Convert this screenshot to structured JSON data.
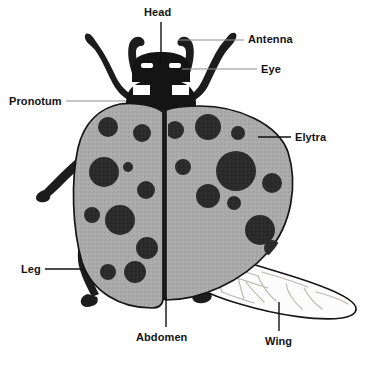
{
  "diagram": {
    "background_color": "#ffffff",
    "colors": {
      "body_dark": "#1f1f1f",
      "elytra_gray": "#a9a9a9",
      "elytra_gray_dark": "#9a9a9a",
      "spot_dark": "#2a2a2a",
      "abdomen_dark": "#3c3c3c",
      "wing_fill": "#fbfbfb",
      "wing_vein": "#b8b3ac",
      "outline": "#111111",
      "leader_gray": "#8f8f8f",
      "leader_black": "#111111",
      "label_text": "#131313"
    },
    "labels": [
      {
        "id": "head",
        "text": "Head",
        "x": 144,
        "y": 6,
        "leader": {
          "style": "black",
          "x1": 161,
          "y1": 22,
          "x2": 161,
          "y2": 66
        }
      },
      {
        "id": "antenna",
        "text": "Antenna",
        "x": 248,
        "y": 33,
        "leader": {
          "style": "gray",
          "x1": 244,
          "y1": 40,
          "x2": 178,
          "y2": 40
        }
      },
      {
        "id": "eye",
        "text": "Eye",
        "x": 261,
        "y": 63,
        "leader": {
          "style": "gray",
          "x1": 257,
          "y1": 69,
          "x2": 182,
          "y2": 69
        }
      },
      {
        "id": "pronotum",
        "text": "Pronotum",
        "x": 9,
        "y": 95,
        "leader": {
          "style": "gray",
          "x1": 66,
          "y1": 101,
          "x2": 126,
          "y2": 101
        }
      },
      {
        "id": "elytra",
        "text": "Elytra",
        "x": 295,
        "y": 131,
        "leader": {
          "style": "black",
          "x1": 291,
          "y1": 137,
          "x2": 258,
          "y2": 137
        }
      },
      {
        "id": "leg",
        "text": "Leg",
        "x": 21,
        "y": 263,
        "leader": {
          "style": "black",
          "x1": 45,
          "y1": 269,
          "x2": 84,
          "y2": 269
        }
      },
      {
        "id": "abdomen",
        "text": "Abdomen",
        "x": 136,
        "y": 331,
        "leader": {
          "style": "black",
          "x1": 166,
          "y1": 327,
          "x2": 166,
          "y2": 297
        }
      },
      {
        "id": "wing",
        "text": "Wing",
        "x": 265,
        "y": 335,
        "leader": {
          "style": "black",
          "x1": 279,
          "y1": 331,
          "x2": 279,
          "y2": 302
        }
      }
    ],
    "parts": {
      "head": "Head",
      "antenna": "Antenna",
      "eye": "Eye",
      "pronotum": "Pronotum",
      "elytra": "Elytra",
      "leg": "Leg",
      "abdomen": "Abdomen",
      "wing": "Wing"
    },
    "elytra_spots": {
      "left": [
        {
          "cx": 108,
          "cy": 127,
          "r": 10
        },
        {
          "cx": 142,
          "cy": 133,
          "r": 9
        },
        {
          "cx": 104,
          "cy": 172,
          "r": 15
        },
        {
          "cx": 128,
          "cy": 167,
          "r": 5
        },
        {
          "cx": 146,
          "cy": 190,
          "r": 9
        },
        {
          "cx": 92,
          "cy": 215,
          "r": 8
        },
        {
          "cx": 120,
          "cy": 220,
          "r": 15
        },
        {
          "cx": 147,
          "cy": 248,
          "r": 11
        },
        {
          "cx": 108,
          "cy": 272,
          "r": 8
        },
        {
          "cx": 135,
          "cy": 272,
          "r": 11
        }
      ],
      "right": [
        {
          "cx": 175,
          "cy": 130,
          "r": 9
        },
        {
          "cx": 208,
          "cy": 127,
          "r": 13
        },
        {
          "cx": 238,
          "cy": 133,
          "r": 7
        },
        {
          "cx": 183,
          "cy": 167,
          "r": 8
        },
        {
          "cx": 236,
          "cy": 171,
          "r": 20
        },
        {
          "cx": 272,
          "cy": 183,
          "r": 10
        },
        {
          "cx": 208,
          "cy": 196,
          "r": 12
        },
        {
          "cx": 234,
          "cy": 203,
          "r": 7
        },
        {
          "cx": 260,
          "cy": 230,
          "r": 15
        },
        {
          "cx": 272,
          "cy": 248,
          "r": 8
        }
      ]
    }
  }
}
